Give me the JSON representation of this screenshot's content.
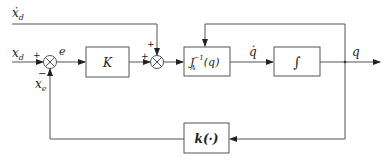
{
  "diagram": {
    "type": "control-block-diagram",
    "inputs": {
      "reference": "x",
      "reference_sub": "d",
      "velocity_ff": "ẋ",
      "velocity_ff_sub": "d"
    },
    "signals": {
      "error": "e",
      "joint_velocity": "q̇",
      "output": "q",
      "feedback": "x",
      "feedback_sub": "e"
    },
    "blocks": {
      "gain": "K",
      "inverse_jacobian": "J",
      "inverse_jacobian_sub": "A",
      "inverse_jacobian_sup": "−1",
      "inverse_jacobian_arg": "(q)",
      "integrator": "∫",
      "forward_kinematics": "k(·)"
    },
    "summing_junctions": {
      "sum1": {
        "plus": "+",
        "minus": "−"
      },
      "sum2": {
        "plus_left": "+",
        "plus_top": "+"
      }
    }
  }
}
